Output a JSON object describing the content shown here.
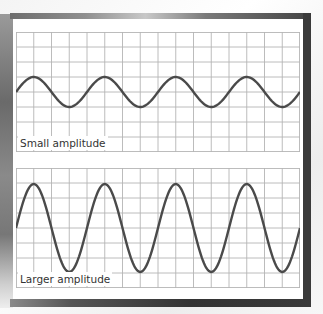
{
  "colors": {
    "grid": "#b4b4b4",
    "wave": "#4a4a4a",
    "frame": "#3a3a3a",
    "panel": "#ffffff"
  },
  "grid": {
    "columns": 16,
    "rows": 8
  },
  "panels": [
    {
      "label": "Small amplitude",
      "amplitude_px": 15,
      "period_columns": 4,
      "cycles": 4
    },
    {
      "label": "Larger amplitude",
      "amplitude_px": 44,
      "period_columns": 4,
      "cycles": 4
    }
  ],
  "chart_data": [
    {
      "type": "line",
      "title": "Small amplitude",
      "xlabel": "",
      "ylabel": "",
      "grid": true,
      "series": [
        {
          "name": "wave",
          "function": "sine",
          "amplitude": 1,
          "cycles": 4,
          "phase": "starts at zero going up"
        }
      ],
      "ylim": [
        -4,
        4
      ]
    },
    {
      "type": "line",
      "title": "Larger amplitude",
      "xlabel": "",
      "ylabel": "",
      "grid": true,
      "series": [
        {
          "name": "wave",
          "function": "sine",
          "amplitude": 3,
          "cycles": 4,
          "phase": "starts at zero going up"
        }
      ],
      "ylim": [
        -4,
        4
      ]
    }
  ]
}
